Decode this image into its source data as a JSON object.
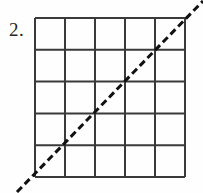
{
  "figure": {
    "label": "2.",
    "background_color": "#fefefe",
    "width": 203,
    "height": 193
  },
  "grid": {
    "name": "square-grid",
    "columns": 5,
    "rows": 5,
    "left": 35,
    "top": 18,
    "right": 185,
    "bottom": 177,
    "cell_width": 30,
    "cell_height": 31.8,
    "line_color": "#3a3a3a",
    "line_width": 2,
    "vertical_lines_x": [
      35,
      65,
      95,
      125,
      155,
      185
    ],
    "horizontal_lines_y": [
      18,
      49.8,
      81.6,
      113.4,
      145.2,
      177
    ]
  },
  "diagonal": {
    "name": "dashed-diagonal-line",
    "description": "dashed line of slope 1 through grid corners",
    "color": "#111111",
    "line_width": 3,
    "dash_length": 7,
    "gap_length": 4,
    "start_x": 17,
    "start_y": 192,
    "end_x": 203,
    "end_y": 1,
    "passes_through": [
      {
        "x": 35,
        "y": 177
      },
      {
        "x": 65,
        "y": 145.2
      },
      {
        "x": 95,
        "y": 113.4
      },
      {
        "x": 125,
        "y": 81.6
      },
      {
        "x": 155,
        "y": 49.8
      },
      {
        "x": 185,
        "y": 18
      }
    ]
  }
}
